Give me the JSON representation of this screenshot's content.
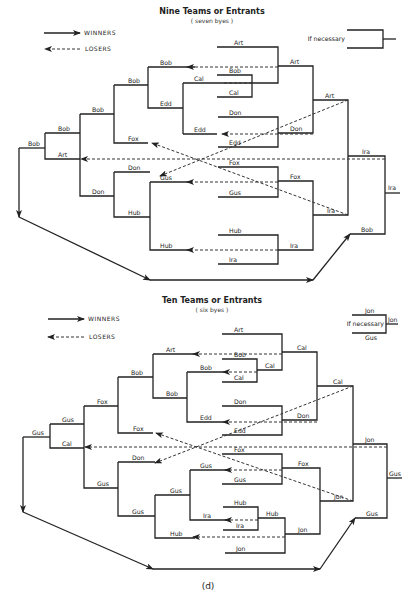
{
  "top": {
    "title": "Nine Teams or Entrants",
    "subtitle": "( seven byes )",
    "legend": {
      "winners": "WINNERS",
      "losers": "LOSERS"
    },
    "if_necessary": "If necessary",
    "labels": {
      "art_r1": "Art",
      "art_r2": "Art",
      "art_r3": "Art",
      "bob_cbox": "Bob",
      "cal_cbox": "Cal",
      "cal_win": "Cal",
      "bob_l1": "Bob",
      "edd_l1": "Edd",
      "bob_l2": "Bob",
      "edd_l2": "Edd",
      "bob_l3": "Bob",
      "fox_l3": "Fox",
      "bob_l4": "Bob",
      "art_l4": "Art",
      "bob_l5": "Bob",
      "don_d": "Don",
      "edd_d": "Edd",
      "don_win": "Don",
      "fox_g": "Fox",
      "gus_g": "Gus",
      "fox_win": "Fox",
      "hub_i": "Hub",
      "ira_i": "Ira",
      "ira_win": "Ira",
      "ira_semi": "Ira",
      "ira_top": "Ira",
      "ira_final": "Ira",
      "bob_final": "Bob",
      "don_l": "Don",
      "gus_l": "Gus",
      "hub_l": "Hub",
      "don_l2": "Don",
      "hub_l2": "Hub"
    }
  },
  "bottom": {
    "title": "Ten Teams or Entrants",
    "subtitle": "( six byes )",
    "legend": {
      "winners": "WINNERS",
      "losers": "LOSERS"
    },
    "if_necessary": "If necessary",
    "if_top": "Jon",
    "if_bottom": "Gus",
    "if_result": "Jon",
    "labels": {
      "art_r1": "Art",
      "bob_cbox": "Bob",
      "cal_cbox": "Cal",
      "cal_win": "Cal",
      "cal_r2": "Cal",
      "cal_r3": "Cal",
      "don_d": "Don",
      "edd_d": "Edd",
      "don_win": "Don",
      "art_l1": "Art",
      "bob_l1": "Bob",
      "bob_l1b": "Bob",
      "edd_l1": "Edd",
      "bob_l2": "Bob",
      "bob_l3": "Bob",
      "fox_l3": "Fox",
      "fox_l4": "Fox",
      "gus_l5": "Gus",
      "gus_l6": "Gus",
      "cal_l5": "Cal",
      "fox_g": "Fox",
      "gus_g": "Gus",
      "fox_win": "Fox",
      "hub_i": "Hub",
      "ira_i": "Ira",
      "hub_win": "Hub",
      "jon_j": "Jon",
      "jon_win": "Jon",
      "jon_semi": "Jon",
      "jon_top": "Jon",
      "gus_final": "Gus",
      "gus_final_in": "Gus",
      "don_l": "Don",
      "gus_l": "Gus",
      "gus_l2": "Gus",
      "gus_l3": "Gus",
      "ira_l": "Ira",
      "hub_l": "Hub",
      "bob_loser_tag": "Bob",
      "edd_loser_tag": "Edd",
      "gus_loser_tag": "Gus",
      "ira_loser_tag": "Ira"
    }
  },
  "caption": "(d)"
}
